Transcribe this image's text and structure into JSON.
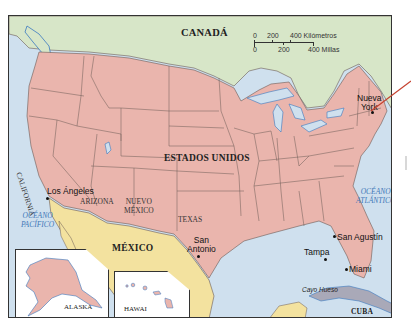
{
  "colors": {
    "usa": "#eab5ad",
    "canada": "#d7e6c8",
    "mexico": "#f3e29f",
    "water": "#cfe0ee",
    "cuba": "#a9a9b8",
    "border": "#6b5a55",
    "ocean_label": "#3f78b8",
    "pointer_line": "#c5412e"
  },
  "labels": {
    "countries": {
      "canada": "CANADÁ",
      "usa": "ESTADOS UNIDOS",
      "mexico": "MÉXICO",
      "cuba": "CUBA"
    },
    "states": {
      "california": "CALIFORNIA",
      "arizona": "ARIZONA",
      "new_mexico_1": "NUEVO",
      "new_mexico_2": "MÉXICO",
      "texas": "TEXAS"
    },
    "oceans": {
      "pacific_1": "OCÉANO",
      "pacific_2": "PACÍFICO",
      "atlantic_1": "OCÉANO",
      "atlantic_2": "ATLÁNTICO"
    },
    "cities": {
      "new_york_1": "Nueva",
      "new_york_2": "York",
      "los_angeles": "Los Ángeles",
      "san_antonio_1": "San",
      "san_antonio_2": "Antonio",
      "san_agustin": "San Agustín",
      "tampa": "Tampa",
      "miami": "Miami",
      "key_west": "Cayo Hueso"
    },
    "insets": {
      "alaska": "ALASKA",
      "hawaii": "HAWAI"
    }
  },
  "scale_bar": {
    "km_ticks": [
      "0",
      "200",
      "400 Kilómetros"
    ],
    "mi_ticks": [
      "0",
      "200",
      "400 Millas"
    ]
  }
}
